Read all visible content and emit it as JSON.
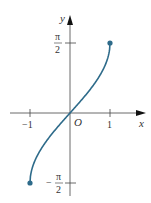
{
  "chart_data": {
    "type": "line",
    "title": "",
    "function": "y = arcsin(x)",
    "xlabel": "x",
    "ylabel": "y",
    "origin_label": "O",
    "x_ticks": [
      {
        "value": -1,
        "label": "−1"
      },
      {
        "value": 1,
        "label": "1"
      }
    ],
    "y_ticks": [
      {
        "value": 1.5708,
        "label_num": "π",
        "label_den": "2",
        "sign": ""
      },
      {
        "value": -1.5708,
        "label_num": "π",
        "label_den": "2",
        "sign": "−"
      }
    ],
    "xlim": [
      -1.5,
      1.5
    ],
    "ylim": [
      -1.9,
      2.0
    ],
    "grid": false,
    "series": [
      {
        "name": "arcsin",
        "color": "#2e6b8a",
        "endpoints": [
          [
            -1,
            -1.5708
          ],
          [
            1,
            1.5708
          ]
        ],
        "x": [
          -1,
          -0.9,
          -0.75,
          -0.5,
          -0.25,
          0,
          0.25,
          0.5,
          0.75,
          0.9,
          1
        ],
        "y": [
          -1.5708,
          -1.1198,
          -0.8481,
          -0.5236,
          -0.2527,
          0,
          0.2527,
          0.5236,
          0.8481,
          1.1198,
          1.5708
        ]
      }
    ]
  }
}
